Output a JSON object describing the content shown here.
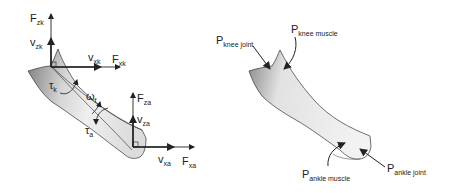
{
  "left_panel": {
    "title": "segment kinematics and kinetics",
    "labels": {
      "F_zk": {
        "main": "F",
        "sub": "zk"
      },
      "v_zk": {
        "main": "v",
        "sub": "zk"
      },
      "v_xk": {
        "main": "v",
        "sub": "xk"
      },
      "F_xk": {
        "main": "F",
        "sub": "xk"
      },
      "tau_k": {
        "main": "τ",
        "sub": "k"
      },
      "omega_f": {
        "main": "ω",
        "sub": "f"
      },
      "tau_a": {
        "main": "τ",
        "sub": "a"
      },
      "F_za": {
        "main": "F",
        "sub": "za"
      },
      "v_za": {
        "main": "v",
        "sub": "za"
      },
      "v_xa": {
        "main": "v",
        "sub": "xa"
      },
      "F_xa": {
        "main": "F",
        "sub": "xa"
      }
    }
  },
  "right_panel": {
    "title": "segment points",
    "labels": {
      "P_knee_joint": {
        "main": "P",
        "sub": "knee joint"
      },
      "P_knee_muscle": {
        "main": "P",
        "sub": "knee muscle"
      },
      "P_ankle_muscle": {
        "main": "P",
        "sub": "ankle muscle"
      },
      "P_ankle_joint": {
        "main": "P",
        "sub": "ankle joint"
      }
    }
  },
  "colors": {
    "ink": "#222222",
    "segment_light": "#ebebeb",
    "segment_dark": "#8a8a8a",
    "background": "#ffffff"
  }
}
